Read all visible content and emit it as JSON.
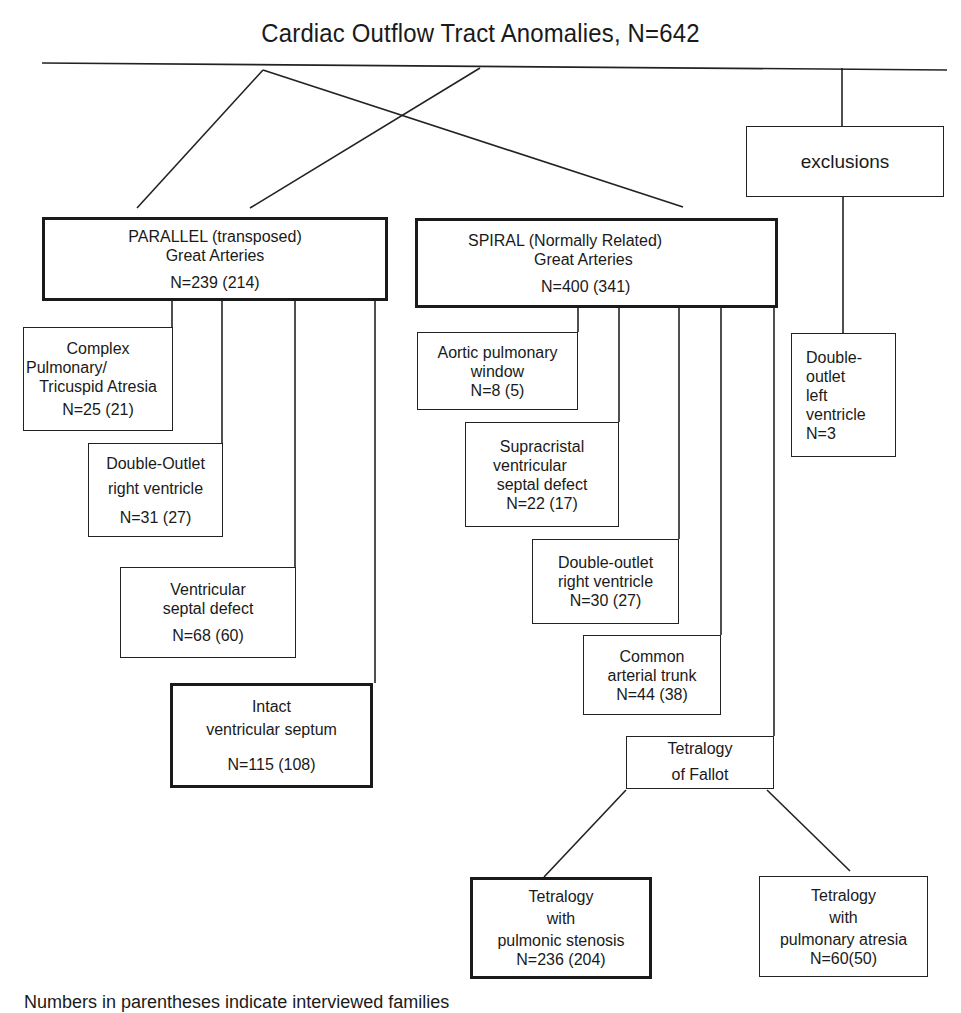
{
  "title": "Cardiac Outflow Tract Anomalies, N=642",
  "root": {
    "label": "Cardiac Outflow Tract Anomalies",
    "n": "N=642"
  },
  "exclusions": {
    "label": "exclusions",
    "children": [
      {
        "lines": [
          "Double-",
          "outlet",
          "left",
          "ventricle"
        ],
        "n": "N=3"
      }
    ]
  },
  "parallel": {
    "lines": [
      "PARALLEL (transposed)",
      "Great Arteries"
    ],
    "n": "N=239 (214)",
    "children": [
      {
        "lines": [
          "Complex",
          "Pulmonary/",
          "Tricuspid Atresia"
        ],
        "n": "N=25 (21)"
      },
      {
        "lines": [
          "Double-Outlet",
          "right ventricle"
        ],
        "n": "N=31 (27)"
      },
      {
        "lines": [
          "Ventricular",
          "septal defect"
        ],
        "n": "N=68 (60)"
      },
      {
        "lines": [
          "Intact",
          "ventricular septum"
        ],
        "n": "N=115 (108)"
      }
    ]
  },
  "spiral": {
    "lines": [
      "SPIRAL (Normally Related)",
      "Great Arteries"
    ],
    "n": "N=400 (341)",
    "children": [
      {
        "lines": [
          "Aortic pulmonary",
          "window"
        ],
        "n": "N=8 (5)"
      },
      {
        "lines": [
          "Supracristal",
          "ventricular",
          "septal defect"
        ],
        "n": "N=22 (17)"
      },
      {
        "lines": [
          "Double-outlet",
          "right ventricle"
        ],
        "n": "N=30 (27)"
      },
      {
        "lines": [
          "Common",
          "arterial trunk"
        ],
        "n": "N=44 (38)"
      },
      {
        "lines": [
          "Tetralogy",
          "of Fallot"
        ],
        "n": ""
      }
    ]
  },
  "tetralogy": {
    "children": [
      {
        "lines": [
          "Tetralogy",
          "with",
          "pulmonic stenosis"
        ],
        "n": "N=236 (204)"
      },
      {
        "lines": [
          "Tetralogy",
          "with",
          "pulmonary atresia"
        ],
        "n": "N=60(50)"
      }
    ]
  },
  "footnote": "Numbers in parentheses indicate interviewed families"
}
